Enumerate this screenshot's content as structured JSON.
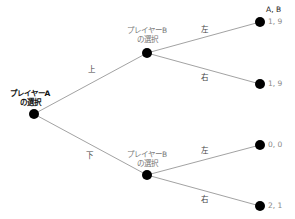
{
  "diagram": {
    "type": "game-tree",
    "header": "A, B",
    "root": {
      "label_line1": "プレイヤーA",
      "label_line2": "の選択"
    },
    "upper_node": {
      "label_line1": "プレイヤーB",
      "label_line2": "の選択",
      "edge_from_root": "上"
    },
    "lower_node": {
      "label_line1": "プレイヤーB",
      "label_line2": "の選択",
      "edge_from_root": "下"
    },
    "leaves": [
      {
        "edge": "左",
        "payoff": "1, 9"
      },
      {
        "edge": "右",
        "payoff": "1, 9"
      },
      {
        "edge": "左",
        "payoff": "0, 0"
      },
      {
        "edge": "右",
        "payoff": "2, 1"
      }
    ],
    "colors": {
      "node": "#000000",
      "edge": "#8a8a8a",
      "payoff_text": "#888888"
    }
  }
}
